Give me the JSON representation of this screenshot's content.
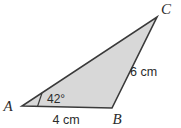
{
  "figure": {
    "type": "triangle-diagram",
    "background_color": "#ffffff",
    "fill_color": "#d8d8d8",
    "stroke_color": "#3a3a3a",
    "text_color": "#2b2b2b",
    "stroke_width": 1.6,
    "width": 181,
    "height": 128,
    "vertices": [
      {
        "name": "A",
        "label": "A",
        "x": 22,
        "y": 106,
        "label_x": 8,
        "label_y": 111
      },
      {
        "name": "B",
        "label": "B",
        "x": 112,
        "y": 108,
        "label_x": 114,
        "label_y": 124
      },
      {
        "name": "C",
        "label": "C",
        "x": 157,
        "y": 17,
        "label_x": 162,
        "label_y": 14
      }
    ],
    "angles": [
      {
        "at_vertex": "A",
        "label": "42°",
        "value": 42,
        "unit": "degrees",
        "label_x": 47,
        "label_y": 103,
        "marker": {
          "x1": 42,
          "y1": 93,
          "x2": 37.5,
          "y2": 106.5
        }
      }
    ],
    "sides": [
      {
        "name": "AB",
        "label": "4 cm",
        "value": 4,
        "unit": "cm",
        "label_x": 44,
        "label_y": 124
      },
      {
        "name": "BC",
        "label": "6 cm",
        "value": 6,
        "unit": "cm",
        "label_x": 130,
        "label_y": 76
      }
    ]
  }
}
